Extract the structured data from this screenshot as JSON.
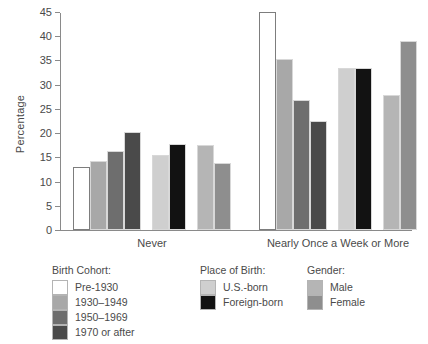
{
  "chart_data": {
    "type": "bar",
    "title": "",
    "xlabel": "",
    "ylabel": "Percentage",
    "ylim": [
      0,
      45
    ],
    "ytick_step": 5,
    "yticks": [
      0,
      5,
      10,
      15,
      20,
      25,
      30,
      35,
      40,
      45
    ],
    "grid": false,
    "legend_position": "below",
    "categories": [
      "Never",
      "Nearly Once a Week or More"
    ],
    "series": [
      {
        "name": "Pre-1930",
        "group": "Birth Cohort",
        "color": "#ffffff",
        "values": [
          13.0,
          45.0
        ]
      },
      {
        "name": "1930–1949",
        "group": "Birth Cohort",
        "color": "#a8a8a8",
        "values": [
          14.3,
          35.3
        ]
      },
      {
        "name": "1950–1969",
        "group": "Birth Cohort",
        "color": "#6e6e6e",
        "values": [
          16.3,
          26.9
        ]
      },
      {
        "name": "1970 or after",
        "group": "Birth Cohort",
        "color": "#4a4a4a",
        "values": [
          20.2,
          22.5
        ]
      },
      {
        "name": "U.S.-born",
        "group": "Place of Birth",
        "color": "#cfcfcf",
        "values": [
          15.4,
          33.5
        ]
      },
      {
        "name": "Foreign-born",
        "group": "Place of Birth",
        "color": "#121212",
        "values": [
          17.8,
          33.5
        ]
      },
      {
        "name": "Male",
        "group": "Gender",
        "color": "#b5b5b5",
        "values": [
          17.6,
          27.9
        ]
      },
      {
        "name": "Female",
        "group": "Gender",
        "color": "#8e8e8e",
        "values": [
          13.8,
          39.1
        ]
      }
    ]
  },
  "axis": {
    "y_title": "Percentage",
    "y_ticks": [
      "0",
      "5",
      "10",
      "15",
      "20",
      "25",
      "30",
      "35",
      "40",
      "45"
    ],
    "x_labels": [
      "Never",
      "Nearly Once a Week or More"
    ]
  },
  "legend": {
    "cohort": {
      "title": "Birth Cohort:",
      "items": [
        {
          "label": "Pre-1930",
          "color": "#ffffff"
        },
        {
          "label": "1930–1949",
          "color": "#a8a8a8"
        },
        {
          "label": "1950–1969",
          "color": "#6e6e6e"
        },
        {
          "label": "1970 or after",
          "color": "#4a4a4a"
        }
      ]
    },
    "birthplace": {
      "title": "Place of Birth:",
      "items": [
        {
          "label": "U.S.-born",
          "color": "#cfcfcf"
        },
        {
          "label": "Foreign-born",
          "color": "#121212"
        }
      ]
    },
    "gender": {
      "title": "Gender:",
      "items": [
        {
          "label": "Male",
          "color": "#b5b5b5"
        },
        {
          "label": "Female",
          "color": "#8e8e8e"
        }
      ]
    }
  }
}
